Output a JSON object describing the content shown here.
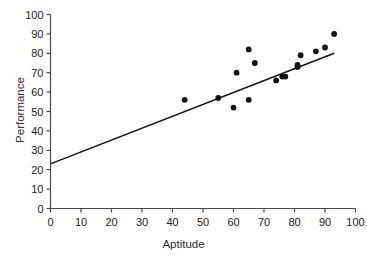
{
  "chart_data": {
    "type": "scatter",
    "title": "",
    "xlabel": "Aptitude",
    "ylabel": "Performance",
    "xlim": [
      0,
      100
    ],
    "ylim": [
      0,
      100
    ],
    "xticks": [
      0,
      10,
      20,
      30,
      40,
      50,
      60,
      70,
      80,
      90,
      100
    ],
    "yticks": [
      0,
      10,
      20,
      30,
      40,
      50,
      60,
      70,
      80,
      90,
      100
    ],
    "grid": false,
    "legend": null,
    "marker_color": "#111111",
    "line_color": "#111111",
    "axis_color": "#4a4a4a",
    "points": [
      {
        "x": 44,
        "y": 56
      },
      {
        "x": 55,
        "y": 57
      },
      {
        "x": 60,
        "y": 52
      },
      {
        "x": 61,
        "y": 70
      },
      {
        "x": 65,
        "y": 56
      },
      {
        "x": 65,
        "y": 82
      },
      {
        "x": 67,
        "y": 75
      },
      {
        "x": 74,
        "y": 66
      },
      {
        "x": 76,
        "y": 68
      },
      {
        "x": 77,
        "y": 68
      },
      {
        "x": 81,
        "y": 74
      },
      {
        "x": 81,
        "y": 73
      },
      {
        "x": 82,
        "y": 79
      },
      {
        "x": 87,
        "y": 81
      },
      {
        "x": 90,
        "y": 83
      },
      {
        "x": 93,
        "y": 90
      }
    ],
    "trendline": {
      "x_start": 0,
      "y_start": 23,
      "x_end": 93,
      "y_end": 80,
      "slope": 0.613,
      "intercept": 23
    }
  }
}
